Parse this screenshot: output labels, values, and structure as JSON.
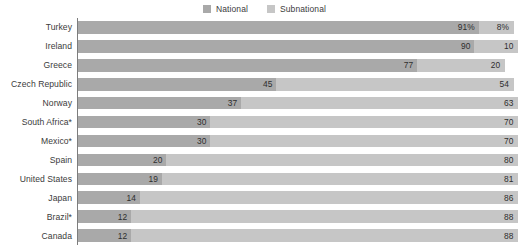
{
  "legend": {
    "items": [
      {
        "label": "National",
        "color": "#a9a9a9",
        "icon": "legend-swatch-icon"
      },
      {
        "label": "Subnational",
        "color": "#c6c6c6",
        "icon": "legend-swatch-icon"
      }
    ]
  },
  "colors": {
    "national": "#a9a9a9",
    "subnational": "#c6c6c6",
    "axis": "#7d7d7d",
    "text": "#3b3b3b",
    "background": "#ffffff"
  },
  "chart_data": {
    "type": "bar",
    "orientation": "horizontal",
    "stacked": true,
    "stack_total": 100,
    "title": "",
    "subtitle": "",
    "xlabel": "",
    "ylabel": "",
    "xlim": [
      0,
      100
    ],
    "grid": false,
    "legend_position": "top-center",
    "categories": [
      "Turkey",
      "Ireland",
      "Greece",
      "Czech Republic",
      "Norway",
      "South Africa*",
      "Mexico*",
      "Spain",
      "United States",
      "Japan",
      "Brazil*",
      "Canada"
    ],
    "series": [
      {
        "name": "National",
        "values": [
          91,
          90,
          77,
          45,
          37,
          30,
          30,
          20,
          19,
          14,
          12,
          12
        ],
        "labels": [
          "91%",
          "90",
          "77",
          "45",
          "37",
          "30",
          "30",
          "20",
          "19",
          "14",
          "12",
          "12"
        ]
      },
      {
        "name": "Subnational",
        "values": [
          8,
          10,
          20,
          54,
          63,
          70,
          70,
          80,
          81,
          86,
          88,
          88
        ],
        "labels": [
          "8%",
          "10",
          "20",
          "54",
          "63",
          "70",
          "70",
          "80",
          "81",
          "86",
          "88",
          "88"
        ]
      }
    ]
  }
}
